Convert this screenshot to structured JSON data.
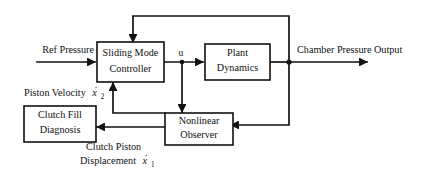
{
  "diagram": {
    "background_color": "#ffffff",
    "line_color": "#111111",
    "blocks": [
      {
        "id": "sliding-mode-controller",
        "line1": "Sliding Mode",
        "line2": "Controller"
      },
      {
        "id": "plant-dynamics",
        "line1": "Plant",
        "line2": "Dynamics"
      },
      {
        "id": "nonlinear-observer",
        "line1": "Nonlinear",
        "line2": "Observer"
      },
      {
        "id": "clutch-fill-diagnosis",
        "line1": "Clutch Fill",
        "line2": "Diagnosis"
      }
    ],
    "labels": {
      "ref_pressure": "Ref Pressure",
      "chamber_pressure_output": "Chamber Pressure Output",
      "control_signal": "u",
      "piston_velocity": "Piston Velocity",
      "piston_velocity_var": "x",
      "piston_velocity_sub": "2",
      "clutch_piston_line1": "Clutch Piston",
      "clutch_piston_line2": "Displacement",
      "clutch_piston_var": "x",
      "clutch_piston_sub": "1"
    }
  }
}
